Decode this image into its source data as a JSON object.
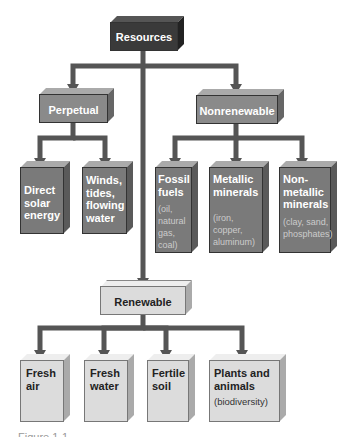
{
  "diagram": {
    "root": {
      "label": "Resources"
    },
    "categories": [
      {
        "label": "Perpetual",
        "children": [
          {
            "title": "Direct solar energy",
            "detail": ""
          },
          {
            "title": "Winds, tides, flowing water",
            "detail": ""
          }
        ]
      },
      {
        "label": "Nonrenewable",
        "children": [
          {
            "title": "Fossil fuels",
            "detail": "(oil, natural gas, coal)"
          },
          {
            "title": "Metallic minerals",
            "detail": "(iron, copper, aluminum)"
          },
          {
            "title": "Non-metallic minerals",
            "detail": "(clay, sand, phosphates)"
          }
        ]
      },
      {
        "label": "Renewable",
        "children": [
          {
            "title": "Fresh air",
            "detail": ""
          },
          {
            "title": "Fresh water",
            "detail": ""
          },
          {
            "title": "Fertile soil",
            "detail": ""
          },
          {
            "title": "Plants and animals",
            "detail": "(biodiversity)"
          }
        ]
      }
    ],
    "caption": "Figure 1-1"
  },
  "colors": {
    "root": "#3a3a3a",
    "category": "#8a8a8a",
    "leaf_dark": "#7a7a7a",
    "renewable": "#dcdcdc",
    "connector": "#555555"
  }
}
